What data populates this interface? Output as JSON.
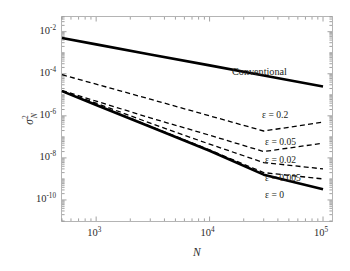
{
  "chart_data": {
    "type": "line",
    "title": "",
    "xlabel": "N",
    "ylabel": "sigma^2_N",
    "ylabel_parts": {
      "symbol": "σ",
      "sup": "2",
      "sub": "N"
    },
    "xscale": "log",
    "yscale": "log",
    "xlim": [
      500,
      120000
    ],
    "ylim": [
      1e-11,
      0.05
    ],
    "grid": false,
    "legend_position": "inline-right",
    "xticks": [
      1000,
      10000,
      100000
    ],
    "xtick_labels": [
      "10³",
      "10⁴",
      "10⁵"
    ],
    "xtick_mantissas": [
      "10",
      "10",
      "10"
    ],
    "xtick_exponents": [
      "3",
      "4",
      "5"
    ],
    "yticks": [
      0.01,
      0.0001,
      1e-06,
      1e-08,
      1e-10
    ],
    "ytick_labels": [
      "10⁻²",
      "10⁻⁴",
      "10⁻⁶",
      "10⁻⁸",
      "10⁻¹⁰"
    ],
    "ytick_mantissas": [
      "10",
      "10",
      "10",
      "10",
      "10"
    ],
    "ytick_exponents": [
      "-2",
      "-4",
      "-6",
      "-8",
      "-10"
    ],
    "series": [
      {
        "name": "Conventional",
        "label": "Conventional",
        "style": "solid",
        "width": 2.6,
        "color": "#000000",
        "x": [
          500,
          1000,
          3000,
          10000,
          30000,
          100000
        ],
        "y": [
          0.005,
          0.0025,
          0.00083,
          0.00025,
          8.3e-05,
          2.5e-05
        ]
      },
      {
        "name": "eps-0.2",
        "label": "ε = 0.2",
        "style": "dashed",
        "width": 1.3,
        "color": "#000000",
        "x": [
          500,
          1000,
          3000,
          10000,
          30000,
          100000
        ],
        "y": [
          9e-05,
          3.2e-05,
          6.2e-06,
          1e-06,
          1.9e-07,
          5e-07
        ]
      },
      {
        "name": "eps-0.05",
        "label": "ε = 0.05",
        "style": "dashed",
        "width": 1.3,
        "color": "#000000",
        "x": [
          500,
          1000,
          3000,
          10000,
          30000,
          100000
        ],
        "y": [
          1.6e-05,
          5e-06,
          8e-07,
          1.2e-07,
          2e-08,
          5e-08
        ]
      },
      {
        "name": "eps-0.02",
        "label": "ε = 0.02",
        "style": "dashed",
        "width": 1.3,
        "color": "#000000",
        "x": [
          500,
          1000,
          3000,
          10000,
          30000,
          100000
        ],
        "y": [
          1.5e-05,
          4e-06,
          4.5e-07,
          4.5e-08,
          6e-09,
          3e-09
        ]
      },
      {
        "name": "eps-0.005",
        "label": "ε = 0.005",
        "style": "dashed",
        "width": 1.3,
        "color": "#000000",
        "x": [
          500,
          1000,
          3000,
          10000,
          30000,
          100000
        ],
        "y": [
          1.5e-05,
          3.5e-06,
          3.2e-07,
          2.4e-08,
          2e-09,
          1e-09
        ]
      },
      {
        "name": "eps-0",
        "label": "ε = 0",
        "style": "solid",
        "width": 2.6,
        "color": "#000000",
        "x": [
          500,
          1000,
          3000,
          10000,
          30000,
          100000
        ],
        "y": [
          1.5e-05,
          3.3e-06,
          3e-07,
          2.2e-08,
          1.6e-09,
          3.2e-10
        ]
      }
    ],
    "annotations": [
      {
        "text": "Conventional",
        "x_px": 232,
        "y_px": 67
      },
      {
        "text": "ε = 0.2",
        "x_px": 262,
        "y_px": 110
      },
      {
        "text": "ε = 0.05",
        "x_px": 265,
        "y_px": 137
      },
      {
        "text": "ε = 0.02",
        "x_px": 265,
        "y_px": 155
      },
      {
        "text": "ε = 0.005",
        "x_px": 265,
        "y_px": 173
      },
      {
        "text": "ε = 0",
        "x_px": 265,
        "y_px": 190
      }
    ]
  },
  "axes": {
    "frame_color": "#b0b0b0",
    "tick_color": "#8a8a8a",
    "x_axis_title": "N",
    "y_axis_symbol": "σ",
    "y_axis_sup": "2",
    "y_axis_sub": "N"
  }
}
